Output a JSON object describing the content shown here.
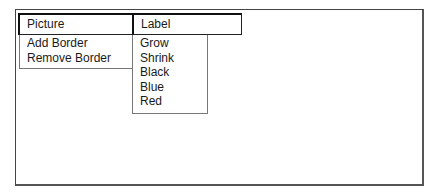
{
  "menubar": {
    "items": [
      {
        "label": "Picture"
      },
      {
        "label": "Label"
      }
    ]
  },
  "menus": {
    "picture": {
      "items": [
        {
          "label": "Add Border"
        },
        {
          "label": "Remove Border"
        }
      ]
    },
    "label": {
      "items": [
        {
          "label": "Grow"
        },
        {
          "label": "Shrink"
        },
        {
          "label": "Black"
        },
        {
          "label": "Blue"
        },
        {
          "label": "Red"
        }
      ]
    }
  }
}
